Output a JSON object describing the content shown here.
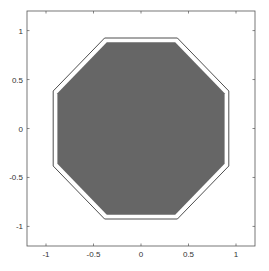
{
  "chart_data": {
    "type": "polygon",
    "title": "",
    "xlabel": "",
    "ylabel": "",
    "xlim": [
      -1.2,
      1.2
    ],
    "ylim": [
      -1.2,
      1.2
    ],
    "grid": false,
    "xticks": [
      -1,
      -0.5,
      0,
      0.5,
      1
    ],
    "yticks": [
      -1,
      -0.5,
      0,
      0.5,
      1
    ],
    "xtick_labels": [
      "-1",
      "-0.5",
      "0",
      "0.5",
      "1"
    ],
    "ytick_labels": [
      "-1",
      "-0.5",
      "0",
      "0.5",
      "1"
    ],
    "series": [
      {
        "name": "outer-octagon-outline",
        "style": "line",
        "color": "#222222",
        "x": [
          -0.383,
          0.383,
          0.924,
          0.924,
          0.383,
          -0.383,
          -0.924,
          -0.924,
          -0.383
        ],
        "y": [
          0.924,
          0.924,
          0.383,
          -0.383,
          -0.924,
          -0.924,
          -0.383,
          0.383,
          0.924
        ]
      },
      {
        "name": "filled-octagon",
        "style": "fill",
        "color": "#666666",
        "x": [
          -0.36,
          0.36,
          0.88,
          0.88,
          0.36,
          -0.36,
          -0.88,
          -0.88
        ],
        "y": [
          0.88,
          0.88,
          0.36,
          -0.36,
          -0.88,
          -0.88,
          -0.36,
          0.36
        ]
      }
    ]
  }
}
